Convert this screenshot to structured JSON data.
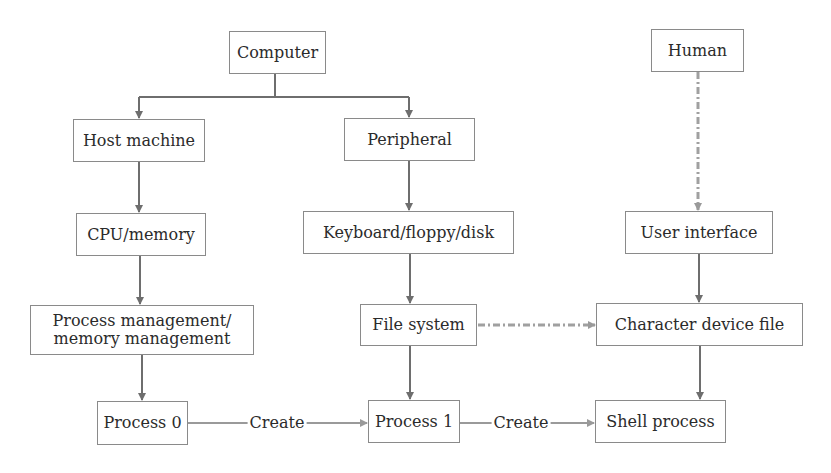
{
  "diagram": {
    "colors": {
      "box_border": "#8a8a8a",
      "solid_arrow": "#6e6e6e",
      "create_arrow": "#9a9a9a",
      "dashed_arrow": "#a0a0a0",
      "text": "#2b2b2b"
    },
    "nodes": [
      {
        "id": "computer",
        "label": "Computer",
        "x": 229,
        "y": 31,
        "w": 97,
        "h": 43
      },
      {
        "id": "human",
        "label": "Human",
        "x": 651,
        "y": 29,
        "w": 93,
        "h": 43
      },
      {
        "id": "host_machine",
        "label": "Host machine",
        "x": 73,
        "y": 119,
        "w": 132,
        "h": 43
      },
      {
        "id": "peripheral",
        "label": "Peripheral",
        "x": 344,
        "y": 118,
        "w": 131,
        "h": 43
      },
      {
        "id": "cpu_memory",
        "label": "CPU/memory",
        "x": 76,
        "y": 213,
        "w": 130,
        "h": 43
      },
      {
        "id": "keyboard_floppy_disk",
        "label": "Keyboard/floppy/disk",
        "x": 303,
        "y": 211,
        "w": 211,
        "h": 43
      },
      {
        "id": "user_interface",
        "label": "User interface",
        "x": 625,
        "y": 211,
        "w": 148,
        "h": 43
      },
      {
        "id": "process_memory_management",
        "label": "Process management/\nmemory management",
        "x": 30,
        "y": 305,
        "w": 224,
        "h": 50
      },
      {
        "id": "file_system",
        "label": "File system",
        "x": 360,
        "y": 304,
        "w": 117,
        "h": 42
      },
      {
        "id": "character_device_file",
        "label": "Character device file",
        "x": 596,
        "y": 303,
        "w": 207,
        "h": 43
      },
      {
        "id": "process_0",
        "label": "Process 0",
        "x": 97,
        "y": 401,
        "w": 91,
        "h": 44
      },
      {
        "id": "process_1",
        "label": "Process 1",
        "x": 368,
        "y": 400,
        "w": 92,
        "h": 43
      },
      {
        "id": "shell_process",
        "label": "Shell process",
        "x": 595,
        "y": 400,
        "w": 131,
        "h": 43
      }
    ],
    "edges": [
      {
        "from": "computer",
        "to": "host_machine",
        "style": "solid"
      },
      {
        "from": "computer",
        "to": "peripheral",
        "style": "solid"
      },
      {
        "from": "host_machine",
        "to": "cpu_memory",
        "style": "solid"
      },
      {
        "from": "cpu_memory",
        "to": "process_memory_management",
        "style": "solid"
      },
      {
        "from": "process_memory_management",
        "to": "process_0",
        "style": "solid"
      },
      {
        "from": "peripheral",
        "to": "keyboard_floppy_disk",
        "style": "solid"
      },
      {
        "from": "keyboard_floppy_disk",
        "to": "file_system",
        "style": "solid"
      },
      {
        "from": "file_system",
        "to": "process_1",
        "style": "solid"
      },
      {
        "from": "human",
        "to": "user_interface",
        "style": "dash-dot"
      },
      {
        "from": "user_interface",
        "to": "character_device_file",
        "style": "solid"
      },
      {
        "from": "character_device_file",
        "to": "shell_process",
        "style": "solid"
      },
      {
        "from": "file_system",
        "to": "character_device_file",
        "style": "dash-dot"
      },
      {
        "from": "process_0",
        "to": "process_1",
        "style": "solid",
        "label": "Create"
      },
      {
        "from": "process_1",
        "to": "shell_process",
        "style": "solid",
        "label": "Create"
      }
    ],
    "edge_labels": {
      "create_0_to_1": "Create",
      "create_1_to_shell": "Create"
    }
  }
}
